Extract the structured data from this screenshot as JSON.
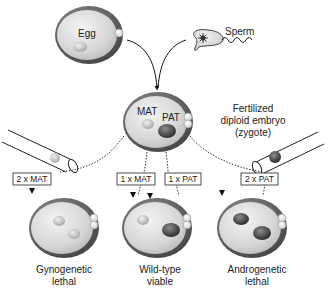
{
  "diagram": {
    "egg_label": "Egg",
    "sperm_label": "Sperm",
    "zygote": {
      "mat_label": "MAT",
      "pat_label": "PAT",
      "caption_line1": "Fertilized",
      "caption_line2": "diploid embryo",
      "caption_line3": "(zygote)"
    },
    "transfer_boxes": [
      {
        "label": "2 x MAT"
      },
      {
        "label": "1 x MAT"
      },
      {
        "label": "1 x PAT"
      },
      {
        "label": "2 x PAT"
      }
    ],
    "outcomes": [
      {
        "line1": "Gynogenetic",
        "line2": "lethal"
      },
      {
        "line1": "Wild-type",
        "line2": "viable"
      },
      {
        "line1": "Androgenetic",
        "line2": "lethal"
      }
    ],
    "colors": {
      "cell_fill": "#d9d9d9",
      "cell_rim": "#555555",
      "mat_pronucleus": "#c8c8c8",
      "pat_pronucleus": "#4a4a4a"
    }
  }
}
